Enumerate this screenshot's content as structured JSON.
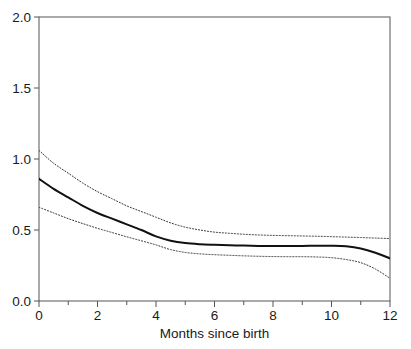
{
  "chart_data": {
    "type": "line",
    "title": "",
    "subtitle": "",
    "xlabel": "Months since birth",
    "ylabel": "",
    "xlim": [
      0,
      12
    ],
    "ylim": [
      0,
      2.0
    ],
    "grid": false,
    "legend_position": "none",
    "x_ticks_major": [
      0,
      2,
      4,
      6,
      8,
      10,
      12
    ],
    "x_ticks_minor": [
      1,
      3,
      5,
      7,
      9,
      11
    ],
    "x_tick_labels": [
      "0",
      "2",
      "4",
      "6",
      "8",
      "10",
      "12"
    ],
    "y_ticks": [
      0.0,
      0.5,
      1.0,
      1.5,
      2.0
    ],
    "y_tick_labels": [
      "0.0",
      "0.5",
      "1.0",
      "1.5",
      "2.0"
    ],
    "x": [
      0,
      0.5,
      1,
      1.5,
      2,
      2.5,
      3,
      3.5,
      4,
      4.5,
      5,
      5.5,
      6,
      6.5,
      7,
      7.5,
      8,
      8.5,
      9,
      9.5,
      10,
      10.5,
      11,
      11.5,
      12
    ],
    "series": [
      {
        "name": "upper confidence limit",
        "style": "dotted",
        "color": "#333333",
        "values": [
          1.06,
          0.97,
          0.9,
          0.83,
          0.77,
          0.72,
          0.67,
          0.63,
          0.59,
          0.55,
          0.52,
          0.5,
          0.485,
          0.477,
          0.47,
          0.465,
          0.462,
          0.46,
          0.458,
          0.456,
          0.453,
          0.45,
          0.447,
          0.443,
          0.44
        ]
      },
      {
        "name": "estimate",
        "style": "solid",
        "color": "#111111",
        "values": [
          0.86,
          0.79,
          0.73,
          0.67,
          0.62,
          0.58,
          0.54,
          0.5,
          0.455,
          0.425,
          0.408,
          0.4,
          0.396,
          0.393,
          0.39,
          0.388,
          0.387,
          0.387,
          0.388,
          0.389,
          0.389,
          0.385,
          0.37,
          0.34,
          0.3
        ]
      },
      {
        "name": "lower confidence limit",
        "style": "dotted",
        "color": "#333333",
        "values": [
          0.66,
          0.62,
          0.58,
          0.545,
          0.512,
          0.482,
          0.452,
          0.424,
          0.395,
          0.362,
          0.342,
          0.332,
          0.326,
          0.322,
          0.318,
          0.315,
          0.313,
          0.312,
          0.312,
          0.31,
          0.305,
          0.292,
          0.27,
          0.225,
          0.16
        ]
      }
    ]
  },
  "axes": {
    "x_axis_name": "Months since birth",
    "y_axis_name": ""
  }
}
